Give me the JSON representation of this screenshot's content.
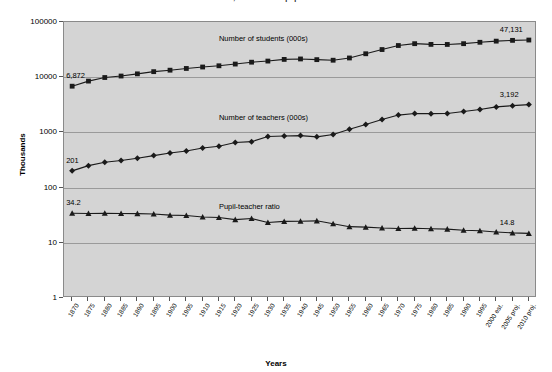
{
  "chart_data": {
    "type": "line",
    "title": "Students, teachers and pupil-teacher ratio",
    "xlabel": "Years",
    "ylabel": "Thousands",
    "yscale": "log",
    "ylim": [
      1,
      100000
    ],
    "yticks": [
      "1",
      "10",
      "100",
      "1000",
      "10000",
      "100000"
    ],
    "grid": true,
    "legend_position": "inline-labels",
    "plot_background": "#d4d4d4",
    "series_color": "#1a1a1a",
    "categories": [
      "1870",
      "1875",
      "1880",
      "1885",
      "1890",
      "1895",
      "1900",
      "1905",
      "1910",
      "1915",
      "1920",
      "1925",
      "1930",
      "1935",
      "1940",
      "1945",
      "1950",
      "1955",
      "1960",
      "1965",
      "1970",
      "1975",
      "1980",
      "1985",
      "1990",
      "1995",
      "2000 est.",
      "2005 proj.",
      "2010 proj."
    ],
    "series": [
      {
        "name": "Number of students (000s)",
        "marker": "square",
        "start_label": "6,872",
        "end_label": "47,131",
        "values": [
          6872,
          8500,
          9867,
          10500,
          11500,
          12600,
          13400,
          14400,
          15300,
          16100,
          17300,
          18700,
          19600,
          21000,
          21400,
          20800,
          20300,
          22300,
          26600,
          31700,
          37500,
          40500,
          39300,
          39200,
          40500,
          42900,
          45000,
          46500,
          47131
        ]
      },
      {
        "name": "Number of teachers (000s)",
        "marker": "diamond",
        "start_label": "201",
        "end_label": "3,192",
        "values": [
          201,
          250,
          287,
          310,
          340,
          380,
          423,
          460,
          523,
          560,
          657,
          680,
          843,
          860,
          875,
          831,
          914,
          1141,
          1387,
          1710,
          2059,
          2196,
          2184,
          2206,
          2398,
          2598,
          2900,
          3050,
          3192
        ]
      },
      {
        "name": "Pupil-teacher ratio",
        "marker": "triangle",
        "start_label": "34.2",
        "end_label": "14.8",
        "values": [
          34.2,
          34.0,
          34.4,
          33.9,
          33.8,
          33.2,
          31.7,
          31.3,
          29.3,
          28.8,
          26.3,
          27.5,
          23.3,
          24.4,
          24.5,
          25.0,
          22.2,
          19.6,
          19.2,
          18.5,
          18.2,
          18.4,
          18.0,
          17.7,
          16.9,
          16.5,
          15.7,
          15.1,
          14.8
        ]
      }
    ],
    "annotations": [
      {
        "text": "Number of students (000s)",
        "series": 0
      },
      {
        "text": "Number of teachers (000s)",
        "series": 1
      },
      {
        "text": "Pupil-teacher ratio",
        "series": 2
      }
    ]
  }
}
